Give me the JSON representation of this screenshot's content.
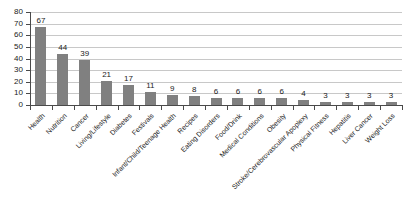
{
  "chart_data": {
    "type": "bar",
    "title": "",
    "subtitle": "",
    "xlabel": "",
    "ylabel": "",
    "ylim": [
      0,
      80
    ],
    "yticks": [
      0,
      10,
      20,
      30,
      40,
      50,
      60,
      70,
      80
    ],
    "grid": true,
    "legend": false,
    "bar_color": "#808080",
    "gridline_color": "#c8c8c8",
    "axis_color": "#4a4a4a",
    "label_rotation_degrees": -45,
    "categories": [
      "Health",
      "Nutrition",
      "Cancer",
      "Living/Lifestyle",
      "Diabetes",
      "Festivals",
      "Infant/Child/Teenage Health",
      "Recipes",
      "Eating Disorders",
      "Food/Drink",
      "Medical Conditions",
      "Obesity",
      "Stroke/Cerebrovascular Apoplexy",
      "Physical Fitness",
      "Hepatitis",
      "Liver Cancer",
      "Weight Loss"
    ],
    "values": [
      67,
      44,
      39,
      21,
      17,
      11,
      9,
      8,
      6,
      6,
      6,
      6,
      4,
      3,
      3,
      3,
      3
    ],
    "value_labels": [
      "67",
      "44",
      "39",
      "21",
      "17",
      "11",
      "9",
      "8",
      "6",
      "6",
      "6",
      "6",
      "4",
      "3",
      "3",
      "3",
      "3"
    ],
    "ytick_labels": [
      "0",
      "10",
      "20",
      "30",
      "40",
      "50",
      "60",
      "70",
      "80"
    ]
  }
}
